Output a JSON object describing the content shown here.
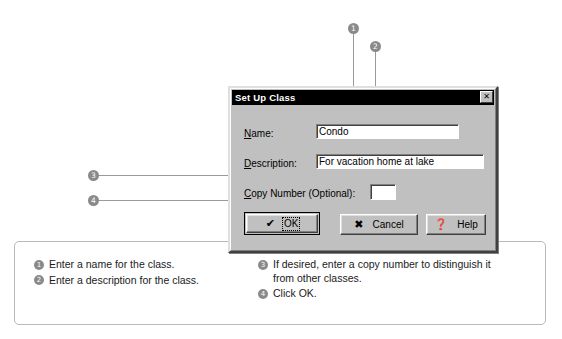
{
  "dialog": {
    "title": "Set Up Class",
    "close_label": "✕",
    "fields": [
      {
        "label_prefix": "N",
        "label_rest": "ame:",
        "value": "Condo",
        "placeholder": ""
      },
      {
        "label_prefix": "D",
        "label_rest": "escription:",
        "value": "For vacation home at lake",
        "placeholder": ""
      },
      {
        "label_prefix": "C",
        "label_rest": "opy Number (Optional):",
        "value": "",
        "placeholder": ""
      }
    ],
    "buttons": [
      {
        "glyph": "✔",
        "label": "OK",
        "default": true
      },
      {
        "glyph": "✖",
        "label": "Cancel",
        "default": false
      },
      {
        "glyph": "❓",
        "label": "Help",
        "default": false
      }
    ]
  },
  "callouts": [
    {
      "number": "1"
    },
    {
      "number": "2"
    },
    {
      "number": "3"
    },
    {
      "number": "4"
    }
  ],
  "captions": {
    "left": [
      {
        "number": "1",
        "text": "Enter a name for the class."
      },
      {
        "number": "2",
        "text": "Enter a description for the class."
      }
    ],
    "right": [
      {
        "number": "3",
        "text": "If desired, enter a copy number to distinguish it from other classes."
      },
      {
        "number": "4",
        "text": "Click OK."
      }
    ]
  },
  "colors": {
    "dialog_face": "#c0c0c0",
    "titlebar": "#000000",
    "callout_gray": "#8a8a8a",
    "leader_gray": "#9a9a9a",
    "panel_border": "#b9b9b9"
  }
}
